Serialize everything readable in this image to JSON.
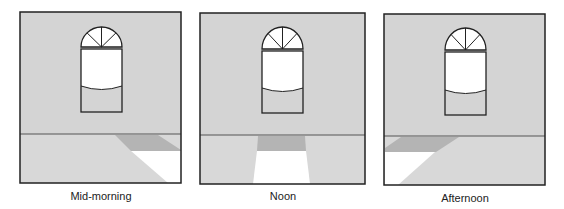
{
  "colors": {
    "wall": "#d4d4d4",
    "floor": "#d8d8d8",
    "shadow_band": "#b4b4b4",
    "sunlight": "#ffffff",
    "outline": "#222222",
    "window_glass": "#ffffff"
  },
  "panels": [
    {
      "caption": "Mid-morning",
      "sun_position": "morning",
      "frame": {
        "x": 20,
        "y": 12,
        "w": 161,
        "h": 171
      },
      "floor_line_y": 134,
      "window": {
        "x": 81,
        "arch_top": 27,
        "arch_base": 47,
        "rect_top": 49,
        "rect_bottom": 112,
        "w": 41,
        "curve_y": 86
      },
      "shadow_band_points": "115,135 158,135 181,150 181,151 131,151",
      "sunlight_points": "131,151 181,151 181,183 168,183"
    },
    {
      "caption": "Noon",
      "sun_position": "noon",
      "frame": {
        "x": 200,
        "y": 13,
        "w": 165,
        "h": 171
      },
      "floor_line_y": 135,
      "window": {
        "x": 262,
        "arch_top": 27,
        "arch_base": 49,
        "rect_top": 51,
        "rect_bottom": 113,
        "w": 41,
        "curve_y": 88
      },
      "shadow_band_points": "258,136 305,136 306,151 257,151",
      "sunlight_points": "257,151 306,151 310,184 253,184"
    },
    {
      "caption": "Afternoon",
      "sun_position": "afternoon",
      "frame": {
        "x": 384,
        "y": 14,
        "w": 161,
        "h": 171
      },
      "floor_line_y": 136,
      "window": {
        "x": 445,
        "arch_top": 28,
        "arch_base": 50,
        "rect_top": 52,
        "rect_bottom": 115,
        "w": 41,
        "curve_y": 90
      },
      "shadow_band_points": "401,137 459,137 436,152 385,152 385,148",
      "sunlight_points": "385,152 435,152 398,185 385,185"
    }
  ]
}
